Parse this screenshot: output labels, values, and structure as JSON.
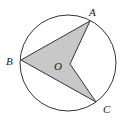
{
  "diagram": {
    "type": "geometry",
    "circle": {
      "cx": 68,
      "cy": 63,
      "r": 48,
      "stroke": "#333333"
    },
    "points": {
      "A": {
        "label": "A",
        "x": 90,
        "y": 21
      },
      "B": {
        "label": "B",
        "x": 21,
        "y": 60
      },
      "C": {
        "label": "C",
        "x": 96,
        "y": 102
      },
      "O": {
        "label": "O",
        "x": 70,
        "y": 64
      }
    },
    "shaded_region": {
      "vertices": [
        "A",
        "B",
        "C",
        "O"
      ],
      "fill": "#c8c8c8"
    },
    "labels": {
      "A": "A",
      "B": "B",
      "C": "C",
      "O": "O"
    }
  }
}
